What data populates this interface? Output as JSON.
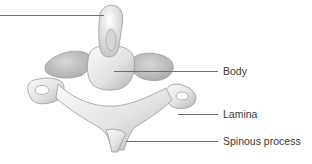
{
  "figure": {
    "labels": [
      {
        "id": "dens",
        "text": "",
        "line": {
          "x1": 0,
          "x2": 104,
          "y": 15
        }
      },
      {
        "id": "body",
        "text": "Body",
        "line": {
          "x1": 114,
          "x2": 218,
          "y": 71
        },
        "text_x": 223,
        "text_y": 65
      },
      {
        "id": "lamina",
        "text": "Lamina",
        "line": {
          "x1": 178,
          "x2": 218,
          "y": 114
        },
        "text_x": 223,
        "text_y": 108
      },
      {
        "id": "spinous",
        "text": "Spinous process",
        "line": {
          "x1": 126,
          "x2": 218,
          "y": 141
        },
        "text_x": 223,
        "text_y": 135
      }
    ],
    "colors": {
      "background": "#ffffff",
      "bone_light": "#f2f2f2",
      "bone_mid": "#cfcfcf",
      "bone_shadow": "#9a9a9a",
      "leader_line": "#6e6e6e",
      "label_text": "#3a3a3a"
    }
  }
}
